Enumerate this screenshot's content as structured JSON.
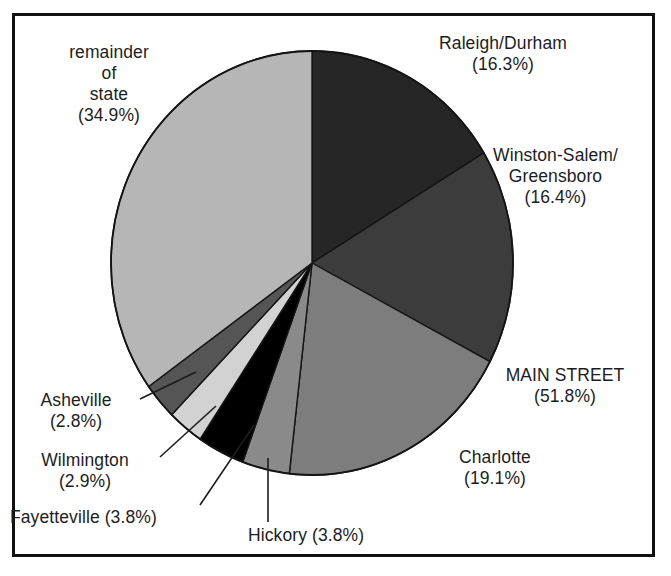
{
  "figure": {
    "background_color": "#ffffff",
    "frame_color": "#111111",
    "text_color": "#1d1d1d"
  },
  "chart_data": {
    "type": "pie",
    "title": "",
    "subtitle": "",
    "xlabel": "",
    "ylabel": "",
    "legend_position": "none",
    "grid": false,
    "start_angle_deg": 0,
    "direction": "clockwise",
    "unit": "%",
    "categories": [
      "Raleigh/Durham",
      "Winston-Salem/ Greensboro",
      "Charlotte",
      "Hickory",
      "Fayetteville",
      "Wilmington",
      "Asheville",
      "remainder of state"
    ],
    "values": [
      16.3,
      16.4,
      19.1,
      3.8,
      3.8,
      2.9,
      2.8,
      34.9
    ],
    "colors": [
      "#262626",
      "#3c3c3c",
      "#7d7d7d",
      "#8a8a8a",
      "#000000",
      "#d2d2d2",
      "#555555",
      "#b6b6b6"
    ],
    "annotations": [
      "MAIN STREET (51.8%) = Raleigh/Durham + Winston-Salem/Greensboro + Charlotte"
    ],
    "slices": [
      {
        "name": "Raleigh/Durham",
        "value": 16.3,
        "color": "#262626"
      },
      {
        "name": "Winston-Salem/ Greensboro",
        "value": 16.4,
        "color": "#3c3c3c"
      },
      {
        "name": "Charlotte",
        "value": 19.1,
        "color": "#7d7d7d"
      },
      {
        "name": "Hickory",
        "value": 3.8,
        "color": "#8a8a8a"
      },
      {
        "name": "Fayetteville",
        "value": 3.8,
        "color": "#000000"
      },
      {
        "name": "Wilmington",
        "value": 2.9,
        "color": "#d2d2d2"
      },
      {
        "name": "Asheville",
        "value": 2.8,
        "color": "#555555"
      },
      {
        "name": "remainder of state",
        "value": 34.9,
        "color": "#b6b6b6"
      }
    ]
  },
  "labels": {
    "raleigh": "Raleigh/Durham\n(16.3%)",
    "winston": "Winston-Salem/\nGreensboro\n(16.4%)",
    "main_street": "MAIN STREET\n(51.8%)",
    "charlotte": "Charlotte\n(19.1%)",
    "remainder": "remainder\nof\nstate\n(34.9%)",
    "asheville": "Asheville\n(2.8%)",
    "wilmington": "Wilmington\n(2.9%)",
    "fayetteville": "Fayetteville (3.8%)",
    "hickory": "Hickory (3.8%)"
  }
}
